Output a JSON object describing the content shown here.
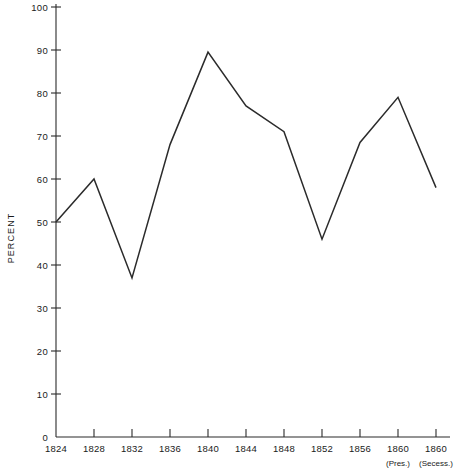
{
  "chart_data": {
    "type": "line",
    "title": "",
    "subtitle": "",
    "xlabel": "",
    "ylabel": "PERCENT",
    "ylim": [
      0,
      100
    ],
    "ytick_step": 10,
    "grid": false,
    "legend": null,
    "legend_position": "none",
    "line_color": "#2b2b2b",
    "axis_color": "#2b2b2b",
    "categories": [
      "1824",
      "1828",
      "1832",
      "1836",
      "1840",
      "1844",
      "1848",
      "1852",
      "1856",
      "1860",
      "1860"
    ],
    "category_sublabels": [
      "",
      "",
      "",
      "",
      "",
      "",
      "",
      "",
      "",
      "(Pres.)",
      "(Secess.)"
    ],
    "values": [
      50,
      60,
      37,
      68,
      89.5,
      77,
      71,
      46,
      68.5,
      79,
      58
    ],
    "ytick_labels": [
      "0",
      "10",
      "20",
      "30",
      "40",
      "50",
      "60",
      "70",
      "80",
      "90",
      "100"
    ],
    "ytick_values": [
      0,
      10,
      20,
      30,
      40,
      50,
      60,
      70,
      80,
      90,
      100
    ]
  },
  "footnote": {
    "left_fragment": "",
    "right_fragment": ""
  }
}
